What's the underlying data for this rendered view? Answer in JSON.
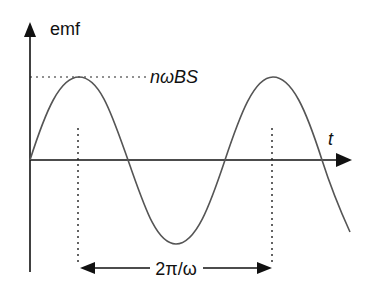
{
  "diagram": {
    "y_axis_label": "emf",
    "x_axis_label": "t",
    "amplitude_label": "nωBS",
    "period_label": "2π/ω",
    "colors": {
      "curve": "#555555",
      "axes": "#111111",
      "dotted": "#222222",
      "text": "#111111"
    }
  }
}
